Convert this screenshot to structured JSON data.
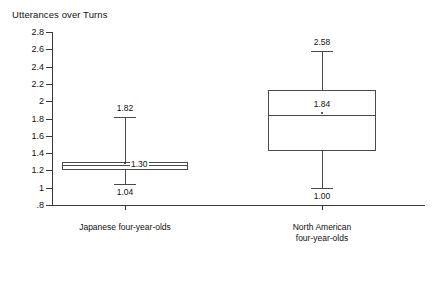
{
  "chart_data": {
    "type": "box",
    "title": "Utterances over Turns",
    "xlabel": "",
    "ylabel": "Utterances over Turns",
    "ylim": [
      0.8,
      2.8
    ],
    "ytick_labels": [
      "2.8",
      "2.6",
      "2.4",
      "2.2",
      "2",
      "1.8",
      "1.6",
      "1.4",
      "1.2",
      "1",
      ".8"
    ],
    "ytick_values": [
      2.8,
      2.6,
      2.4,
      2.2,
      2.0,
      1.8,
      1.6,
      1.4,
      1.2,
      1.0,
      0.8
    ],
    "grid": false,
    "legend": "none",
    "categories": [
      "Japanese four-year-olds",
      "North American four-year-olds"
    ],
    "series": [
      {
        "name": "Japanese four-year-olds",
        "label_line1": "Japanese four-year-olds",
        "label_line2": "",
        "whisker_high": 1.82,
        "q3": 1.3,
        "median": 1.26,
        "q1": 1.21,
        "whisker_low": 1.04,
        "labels": {
          "whisker_high": "1.82",
          "median": "1.30",
          "whisker_low": "1.04"
        }
      },
      {
        "name": "North American four-year-olds",
        "label_line1": "North American",
        "label_line2": "four-year-olds",
        "whisker_high": 2.58,
        "q3": 2.13,
        "median": 1.84,
        "q1": 1.43,
        "whisker_low": 1.0,
        "labels": {
          "whisker_high": "2.58",
          "median": "1.84",
          "whisker_low": "1.00"
        }
      }
    ]
  },
  "colors": {
    "axis": "#3a3a3a",
    "box_stroke": "#4a4a4a",
    "box_fill": "#ffffff",
    "text": "#111111",
    "background": "#ffffff"
  }
}
